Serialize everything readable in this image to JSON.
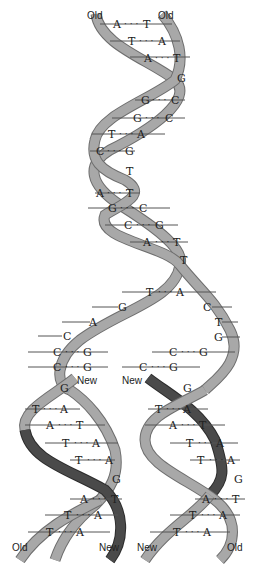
{
  "diagram": {
    "type": "dna-replication",
    "colors": {
      "old_strand": "#a8a8a8",
      "new_strand": "#4a4a4a",
      "text": "#222222"
    },
    "labels": {
      "top_left": "Old",
      "top_right": "Old",
      "fork_new_left": "New",
      "fork_new_right": "New",
      "bottom_1": "Old",
      "bottom_2": "New",
      "bottom_3": "New",
      "bottom_4": "Old"
    },
    "parent_pairs": [
      {
        "left": "A",
        "right": "T"
      },
      {
        "left": "T",
        "right": "A"
      },
      {
        "left": "A",
        "right": "T"
      },
      {
        "single": "G"
      },
      {
        "left": "G",
        "right": "C"
      },
      {
        "left": "G",
        "right": "C"
      },
      {
        "left": "T",
        "right": "A"
      },
      {
        "left": "C",
        "right": "G"
      },
      {
        "single": "T"
      },
      {
        "left": "A",
        "right": "T"
      },
      {
        "left": "G",
        "right": "C"
      },
      {
        "left": "C",
        "right": "G"
      },
      {
        "left": "A",
        "right": "T"
      },
      {
        "single": "T"
      },
      {
        "left": "T",
        "right": "A"
      }
    ],
    "fork_left_unpaired": [
      "G",
      "A",
      "C"
    ],
    "fork_right_unpaired": [
      "C",
      "T",
      "G"
    ],
    "fork_left_pairs": [
      {
        "left": "C",
        "right": "G"
      },
      {
        "left": "C",
        "right": "G"
      }
    ],
    "fork_right_pairs": [
      {
        "left": "C",
        "right": "G"
      },
      {
        "left": "C",
        "right": "G"
      }
    ],
    "left_daughter": {
      "crossing_base": "G",
      "pairs": [
        {
          "left": "T",
          "right": "A"
        },
        {
          "left": "A",
          "right": "T"
        },
        {
          "left": "T",
          "right": "A"
        },
        {
          "left": "T",
          "right": "A"
        }
      ],
      "crossing_base_2": "G",
      "pairs_2": [
        {
          "left": "A",
          "right": "T"
        },
        {
          "left": "T",
          "right": "A"
        },
        {
          "left": "T",
          "right": "A"
        }
      ]
    },
    "right_daughter": {
      "crossing_base": "G",
      "pairs": [
        {
          "left": "T",
          "right": "A"
        },
        {
          "left": "A",
          "right": "T"
        },
        {
          "left": "T",
          "right": "A"
        },
        {
          "left": "T",
          "right": "A"
        }
      ],
      "crossing_base_2": "G",
      "pairs_2": [
        {
          "left": "A",
          "right": "T"
        },
        {
          "left": "T",
          "right": "A"
        },
        {
          "left": "T",
          "right": "A"
        }
      ]
    },
    "dot_separator": "· · ·"
  }
}
